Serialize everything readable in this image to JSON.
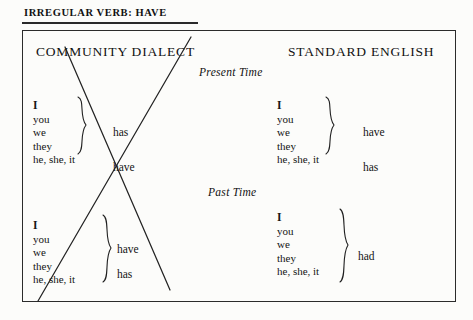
{
  "caption": {
    "text": "IRREGULAR VERB: HAVE"
  },
  "columns": {
    "left_heading": "COMMUNITY DIALECT",
    "right_heading": "STANDARD ENGLISH"
  },
  "tenses": {
    "present": "Present Time",
    "past": "Past Time"
  },
  "community_dialect": {
    "present": {
      "group_pronouns": [
        "I",
        "you",
        "we",
        "they"
      ],
      "group_verb": "has",
      "singular_pronoun": "he, she, it",
      "singular_verb": "have"
    },
    "past": {
      "group_pronouns": [
        "I",
        "you",
        "we",
        "they",
        "he, she, it"
      ],
      "verb_upper": "have",
      "verb_lower": "has"
    }
  },
  "standard_english": {
    "present": {
      "group_pronouns": [
        "I",
        "you",
        "we",
        "they"
      ],
      "group_verb": "have",
      "singular_pronoun": "he, she, it",
      "singular_verb": "has"
    },
    "past": {
      "group_pronouns": [
        "I",
        "you",
        "we",
        "they",
        "he, she, it"
      ],
      "verb": "had"
    }
  },
  "annotation": {
    "mark": "x-cross-out",
    "meaning": "crossed out community dialect forms"
  },
  "colors": {
    "ink": "#1a1a1a",
    "paper": "#fcfcfa",
    "border": "#2b2b2b"
  }
}
